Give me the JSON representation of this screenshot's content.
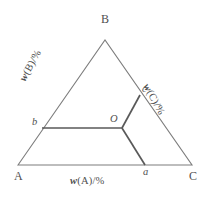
{
  "figure": {
    "kind": "ternary-composition-diagram",
    "background_color": "#ffffff",
    "outline_color": "#7d7d7d",
    "interior_line_color": "#595959",
    "text_color": "#4f4f4f"
  },
  "vertices": [
    {
      "id": "A",
      "label": "A",
      "x": 18,
      "y": 165
    },
    {
      "id": "B",
      "label": "B",
      "x": 105,
      "y": 40
    },
    {
      "id": "C",
      "label": "C",
      "x": 192,
      "y": 165
    }
  ],
  "points": [
    {
      "id": "O",
      "label": "O",
      "x": 122,
      "y": 128,
      "on": "interior"
    },
    {
      "id": "a",
      "label": "a",
      "x": 145,
      "y": 165,
      "on": "edge-AC"
    },
    {
      "id": "b",
      "label": "b",
      "x": 42,
      "y": 128,
      "on": "edge-AB"
    },
    {
      "id": "c",
      "label": "c",
      "x": 140,
      "y": 95,
      "on": "edge-BC"
    }
  ],
  "construction_lines": [
    {
      "id": "line-b-O",
      "from": "b",
      "to": "O"
    },
    {
      "id": "line-O-c",
      "from": "O",
      "to": "c"
    },
    {
      "id": "line-O-a",
      "from": "O",
      "to": "a"
    }
  ],
  "axis_labels": {
    "bottom": {
      "symbol": "w",
      "rest": "(A)/%",
      "full": "w(A)/%"
    },
    "left": {
      "symbol": "w",
      "rest": "(B)/%",
      "full": "w(B)/%"
    },
    "right": {
      "symbol": "w",
      "rest": "(C)/%",
      "full": "w(C)/%"
    }
  },
  "chart_data": {
    "type": "scatter",
    "title": "",
    "xlabel": "w(A)/%",
    "ylabel": "w(B)/%",
    "triangle_vertices": {
      "A": [
        18,
        165
      ],
      "B": [
        105,
        40
      ],
      "C": [
        192,
        165
      ]
    },
    "series": [
      {
        "name": "composition point",
        "points": [
          {
            "label": "O",
            "x": 122,
            "y": 128
          }
        ]
      },
      {
        "name": "edge projections",
        "points": [
          {
            "label": "a",
            "x": 145,
            "y": 165
          },
          {
            "label": "b",
            "x": 42,
            "y": 128
          },
          {
            "label": "c",
            "x": 140,
            "y": 95
          }
        ]
      }
    ],
    "legend": [],
    "grid": false
  }
}
